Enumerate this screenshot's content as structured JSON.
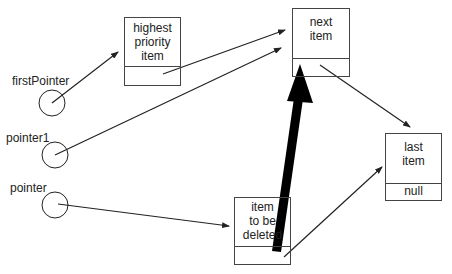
{
  "pointers": [
    {
      "id": "firstPointer",
      "label": "firstPointer"
    },
    {
      "id": "pointer1",
      "label": "pointer1"
    },
    {
      "id": "pointer",
      "label": "pointer"
    }
  ],
  "nodes": {
    "highest": {
      "lines": [
        "highest",
        "priority",
        "item"
      ],
      "next": ""
    },
    "next": {
      "lines": [
        "next",
        "item"
      ],
      "next": ""
    },
    "last": {
      "lines": [
        "last",
        "item"
      ],
      "next": "null"
    },
    "deleted": {
      "lines": [
        "item",
        "to be",
        "deleted"
      ],
      "next": ""
    }
  },
  "colors": {
    "line": "#222222",
    "box_border": "#444444",
    "bold_arrow": "#000000"
  }
}
